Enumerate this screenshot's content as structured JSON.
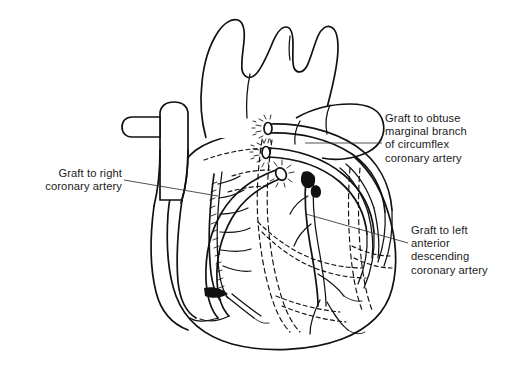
{
  "figure": {
    "background_color": "#ffffff",
    "line_color": "#111111",
    "view": "anterior"
  },
  "labels": [
    {
      "id": "graft-right-coronary",
      "text": "Graft to right\ncoronary artery",
      "align": "right",
      "leader": "line from label to right coronary graft on right heart border"
    },
    {
      "id": "graft-obtuse-marginal",
      "text": "Graft to obtuse\nmarginal branch\nof circumflex\ncoronary artery",
      "align": "left",
      "leader": "horizontal line from label to uppermost graft"
    },
    {
      "id": "graft-lad",
      "text": "Graft to left\nanterior\ndescending\ncoronary artery",
      "align": "left",
      "leader": "line from label to left anterior descending graft anastomosis"
    }
  ],
  "anatomy": {
    "structures": [
      "aortic arch",
      "brachiocephalic artery",
      "left common carotid artery",
      "left subclavian artery",
      "ascending aorta",
      "superior vena cava",
      "azygos vein",
      "pulmonary artery",
      "right atrium",
      "right ventricle",
      "left ventricle",
      "right coronary artery",
      "left anterior descending coronary artery",
      "circumflex coronary artery",
      "obtuse marginal branch"
    ],
    "grafts": [
      {
        "name": "graft-to-obtuse-marginal",
        "proximal": "ascending aorta",
        "distal": "obtuse marginal branch of circumflex"
      },
      {
        "name": "graft-to-left-anterior-descending",
        "proximal": "ascending aorta",
        "distal": "left anterior descending coronary artery"
      },
      {
        "name": "graft-to-right-coronary",
        "proximal": "ascending aorta",
        "distal": "right coronary artery"
      }
    ],
    "notation": {
      "dashed_lines": "hidden / posterior vessels and chamber outlines",
      "stipple_marks": "suture lines at anastomoses"
    }
  }
}
